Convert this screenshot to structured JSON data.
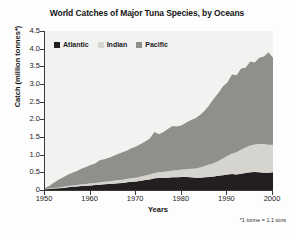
{
  "chart_data": {
    "type": "area",
    "stacked": true,
    "title": "World Catches of Major Tuna Species, by Oceans",
    "xlabel": "Years",
    "ylabel": "Catch (million tonnes*)",
    "footnote": "*1 tonne = 1.1 tons",
    "xlim": [
      1950,
      2000
    ],
    "ylim": [
      0,
      4.5
    ],
    "grid": false,
    "legend_position": "top-left-inside",
    "xticks": [
      1950,
      1960,
      1970,
      1980,
      1990,
      2000
    ],
    "xtick_labels": [
      "1950",
      "1960",
      "1970",
      "1980",
      "1990",
      "2000"
    ],
    "yticks": [
      0,
      0.5,
      1.0,
      1.5,
      2.0,
      2.5,
      3.0,
      3.5,
      4.0,
      4.5
    ],
    "ytick_labels": [
      "0",
      "0.5",
      "1.0",
      "1.5",
      "2.0",
      "2.5",
      "3.0",
      "3.5",
      "4.0",
      "4.5"
    ],
    "colors": {
      "atlantic": "#231f20",
      "indian": "#d6d4cf",
      "pacific": "#8f8f8c",
      "plot_background": "#f2f2f1",
      "axis": "#3a3a3a"
    },
    "x": [
      1950,
      1951,
      1952,
      1953,
      1954,
      1955,
      1956,
      1957,
      1958,
      1959,
      1960,
      1961,
      1962,
      1963,
      1964,
      1965,
      1966,
      1967,
      1968,
      1969,
      1970,
      1971,
      1972,
      1973,
      1974,
      1975,
      1976,
      1977,
      1978,
      1979,
      1980,
      1981,
      1982,
      1983,
      1984,
      1985,
      1986,
      1987,
      1988,
      1989,
      1990,
      1991,
      1992,
      1993,
      1994,
      1995,
      1996,
      1997,
      1998,
      1999,
      2000
    ],
    "series": [
      {
        "name": "Atlantic",
        "color": "#231f20",
        "values": [
          0.02,
          0.03,
          0.04,
          0.05,
          0.06,
          0.08,
          0.09,
          0.1,
          0.11,
          0.12,
          0.13,
          0.14,
          0.15,
          0.16,
          0.17,
          0.18,
          0.19,
          0.2,
          0.22,
          0.23,
          0.24,
          0.26,
          0.28,
          0.3,
          0.33,
          0.34,
          0.35,
          0.35,
          0.36,
          0.36,
          0.37,
          0.37,
          0.36,
          0.35,
          0.35,
          0.36,
          0.37,
          0.38,
          0.4,
          0.42,
          0.44,
          0.45,
          0.44,
          0.46,
          0.48,
          0.5,
          0.51,
          0.5,
          0.49,
          0.49,
          0.5
        ]
      },
      {
        "name": "Indian",
        "color": "#d6d4cf",
        "values": [
          0.01,
          0.01,
          0.02,
          0.02,
          0.03,
          0.03,
          0.04,
          0.04,
          0.05,
          0.05,
          0.06,
          0.06,
          0.07,
          0.07,
          0.08,
          0.08,
          0.09,
          0.09,
          0.1,
          0.11,
          0.11,
          0.12,
          0.13,
          0.14,
          0.15,
          0.16,
          0.17,
          0.18,
          0.19,
          0.2,
          0.21,
          0.22,
          0.24,
          0.26,
          0.29,
          0.32,
          0.35,
          0.38,
          0.42,
          0.47,
          0.52,
          0.58,
          0.63,
          0.68,
          0.72,
          0.76,
          0.78,
          0.8,
          0.81,
          0.79,
          0.78
        ]
      },
      {
        "name": "Pacific",
        "color": "#8f8f8c",
        "values": [
          0.03,
          0.08,
          0.15,
          0.22,
          0.27,
          0.32,
          0.36,
          0.4,
          0.44,
          0.48,
          0.52,
          0.55,
          0.62,
          0.64,
          0.66,
          0.7,
          0.74,
          0.78,
          0.8,
          0.84,
          0.88,
          0.92,
          0.96,
          1.02,
          1.16,
          1.08,
          1.12,
          1.2,
          1.26,
          1.24,
          1.25,
          1.32,
          1.38,
          1.42,
          1.48,
          1.56,
          1.68,
          1.82,
          1.92,
          2.04,
          2.08,
          2.24,
          2.18,
          2.3,
          2.26,
          2.38,
          2.32,
          2.44,
          2.48,
          2.62,
          2.46
        ]
      }
    ],
    "totals": [
      0.06,
      0.12,
      0.21,
      0.29,
      0.36,
      0.43,
      0.49,
      0.54,
      0.6,
      0.65,
      0.71,
      0.75,
      0.84,
      0.87,
      0.91,
      0.96,
      1.02,
      1.07,
      1.12,
      1.18,
      1.23,
      1.3,
      1.37,
      1.46,
      1.64,
      1.58,
      1.64,
      1.73,
      1.81,
      1.8,
      1.83,
      1.91,
      1.98,
      2.03,
      2.12,
      2.24,
      2.4,
      2.58,
      2.74,
      2.93,
      3.04,
      3.27,
      3.25,
      3.44,
      3.46,
      3.64,
      3.61,
      3.74,
      3.78,
      3.9,
      3.74
    ]
  }
}
